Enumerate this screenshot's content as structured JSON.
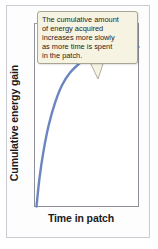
{
  "figure": {
    "background_color": "#fdfdfe",
    "frame_color": "#c9ccd2"
  },
  "callout": {
    "background_color": "#f6f3e2",
    "border_color": "#a8a594",
    "text": "The cumulative amount of energy acquired increases more slowly as more time is spent in the patch.",
    "lines": [
      "The cumulative amount",
      "of energy acquired",
      "increases more slowly",
      "as more time is spent",
      "in the patch."
    ]
  },
  "chart_data": {
    "type": "line",
    "title": "",
    "xlabel": "Time in patch",
    "ylabel": "Cumulative energy gain",
    "xlim": [
      0,
      10
    ],
    "ylim": [
      0,
      10
    ],
    "grid": false,
    "legend": false,
    "xticks": [],
    "yticks": [],
    "axis_color": "#8d9099",
    "series": [
      {
        "name": "Cumulative energy gain",
        "color": "#6b85c0",
        "line_width": 2,
        "x": [
          0,
          0.3,
          0.7,
          1.2,
          1.8,
          2.5,
          3.3,
          4.2,
          5.2,
          6.3,
          7.5,
          8.7,
          10
        ],
        "y": [
          0,
          1.6,
          3.1,
          4.5,
          5.7,
          6.7,
          7.4,
          7.9,
          8.3,
          8.55,
          8.7,
          8.78,
          8.82
        ]
      }
    ],
    "annotations": [
      {
        "text": "The cumulative amount of energy acquired increases more slowly as more time is spent in the patch.",
        "points_to_x": 5.9,
        "points_to_y": 8.5
      }
    ]
  }
}
